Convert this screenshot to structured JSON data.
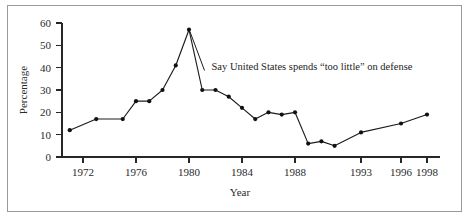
{
  "chart_data": {
    "type": "line",
    "title": "",
    "subtitle": "",
    "xlabel": "Year",
    "ylabel": "Percentage",
    "xlim": [
      1970.4,
      1998.6
    ],
    "ylim": [
      0,
      62
    ],
    "grid": false,
    "legend": "none",
    "annotations": [
      {
        "text": "Say United States spends “too little” on defense",
        "x": 1981.7,
        "y": 45,
        "leader_to_x": 1980.0,
        "leader_to_y": 57
      }
    ],
    "x_ticks": [
      1972,
      1976,
      1980,
      1984,
      1988,
      1993,
      1996,
      1998
    ],
    "x_tick_labels": [
      "1972",
      "1976",
      "1980",
      "1984",
      "1988",
      "1993",
      "1996",
      "1998"
    ],
    "y_ticks": [
      0,
      10,
      20,
      30,
      40,
      50,
      60
    ],
    "y_tick_labels": [
      "0",
      "10",
      "20",
      "30",
      "40",
      "50",
      "60"
    ],
    "series": [
      {
        "name": "Say United States spends “too little” on defense",
        "marker": "filled-circle",
        "color": "#111111",
        "x": [
          1971,
          1973,
          1975,
          1976,
          1977,
          1978,
          1979,
          1980,
          1981,
          1982,
          1983,
          1984,
          1985,
          1986,
          1987,
          1988,
          1989,
          1990,
          1991,
          1993,
          1996,
          1998
        ],
        "values": [
          12,
          17,
          17,
          25,
          25,
          30,
          41,
          57,
          30,
          30,
          27,
          22,
          17,
          20,
          19,
          20,
          6,
          7,
          5,
          11,
          15,
          19
        ]
      }
    ],
    "points": [
      {
        "x": 1971,
        "y": 12
      },
      {
        "x": 1973,
        "y": 17
      },
      {
        "x": 1975,
        "y": 17
      },
      {
        "x": 1976,
        "y": 25
      },
      {
        "x": 1977,
        "y": 25
      },
      {
        "x": 1978,
        "y": 30
      },
      {
        "x": 1979,
        "y": 41
      },
      {
        "x": 1980,
        "y": 57
      },
      {
        "x": 1981,
        "y": 30
      },
      {
        "x": 1982,
        "y": 30
      },
      {
        "x": 1983,
        "y": 27
      },
      {
        "x": 1984,
        "y": 22
      },
      {
        "x": 1985,
        "y": 17
      },
      {
        "x": 1986,
        "y": 20
      },
      {
        "x": 1987,
        "y": 19
      },
      {
        "x": 1988,
        "y": 20
      },
      {
        "x": 1989,
        "y": 6
      },
      {
        "x": 1990,
        "y": 7
      },
      {
        "x": 1991,
        "y": 5
      },
      {
        "x": 1993,
        "y": 11
      },
      {
        "x": 1996,
        "y": 15
      },
      {
        "x": 1998,
        "y": 19
      }
    ]
  }
}
